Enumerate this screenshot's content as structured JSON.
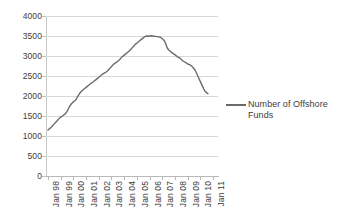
{
  "chart_data": {
    "type": "line",
    "title": "",
    "xlabel": "",
    "ylabel": "",
    "ylim": [
      0,
      4000
    ],
    "y_ticks": [
      0,
      500,
      1000,
      1500,
      2000,
      2500,
      3000,
      3500,
      4000
    ],
    "y_tick_labels": [
      "0",
      "500",
      "1000",
      "1500",
      "2000",
      "2500",
      "3000",
      "3500",
      "4000"
    ],
    "grid": true,
    "grid_axis": "y",
    "legend_position": "right",
    "categories": [
      "Jan 98",
      "Jan 99",
      "Jan 00",
      "Jan 01",
      "Jan 02",
      "Jan 03",
      "Jan 04",
      "Jan 05",
      "Jan 06",
      "Jan 07",
      "Jan 08",
      "Jan 09",
      "Jan 10",
      "Jan 11"
    ],
    "series": [
      {
        "name": "Number of Offshore Funds",
        "color": "#6b6b6b",
        "values": [
          1150,
          1500,
          1850,
          2150,
          2400,
          2600,
          2850,
          3100,
          3350,
          3500,
          3420,
          3050,
          2750,
          2300
        ],
        "monthly_values": [
          1150,
          1180,
          1210,
          1250,
          1290,
          1330,
          1370,
          1410,
          1450,
          1480,
          1500,
          1530,
          1560,
          1610,
          1680,
          1750,
          1800,
          1840,
          1870,
          1900,
          1960,
          2020,
          2080,
          2120,
          2150,
          2180,
          2210,
          2240,
          2270,
          2300,
          2330,
          2350,
          2380,
          2410,
          2440,
          2470,
          2500,
          2530,
          2560,
          2580,
          2600,
          2630,
          2670,
          2710,
          2750,
          2790,
          2820,
          2840,
          2870,
          2900,
          2940,
          2980,
          3010,
          3040,
          3070,
          3100,
          3130,
          3170,
          3210,
          3250,
          3290,
          3320,
          3350,
          3380,
          3410,
          3440,
          3470,
          3490,
          3500,
          3495,
          3500,
          3505,
          3500,
          3495,
          3490,
          3485,
          3480,
          3470,
          3450,
          3420,
          3380,
          3300,
          3200,
          3150,
          3120,
          3090,
          3060,
          3040,
          3010,
          2980,
          2960,
          2940,
          2900,
          2870,
          2850,
          2830,
          2800,
          2790,
          2770,
          2740,
          2700,
          2650,
          2580,
          2500,
          2420,
          2340,
          2260,
          2180,
          2120,
          2080,
          2060
        ],
        "start_value": 1150,
        "peak_value": 3505,
        "peak_label": "Jan 07",
        "end_value": 2060
      }
    ]
  },
  "legend": {
    "label": "Number of Offshore Funds"
  }
}
